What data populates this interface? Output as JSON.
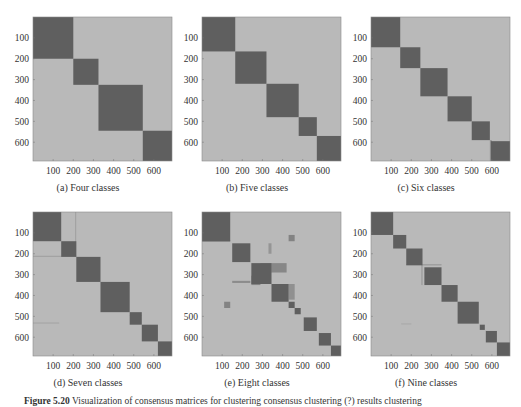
{
  "figure": {
    "label": "Figure 5.20",
    "caption_text": "Visualization of consensus matrices for clustering consensus clustering (?) results clustering"
  },
  "colors": {
    "background_cell": "#b9b9b9",
    "block": "#5f5f5f",
    "frame": "#8a8a8a"
  },
  "chart_data": [
    {
      "type": "heatmap",
      "title": "(a) Four classes",
      "xlabel": "",
      "ylabel": "",
      "xlim": [
        0,
        690
      ],
      "ylim": [
        0,
        690
      ],
      "xticks": [
        100,
        200,
        300,
        400,
        500,
        600
      ],
      "yticks": [
        100,
        200,
        300,
        400,
        500,
        600
      ],
      "blocks": [
        [
          0,
          200
        ],
        [
          200,
          325
        ],
        [
          325,
          545
        ],
        [
          545,
          690
        ]
      ],
      "noise": []
    },
    {
      "type": "heatmap",
      "title": "(b) Five classes",
      "xlabel": "",
      "ylabel": "",
      "xlim": [
        0,
        690
      ],
      "ylim": [
        0,
        690
      ],
      "xticks": [
        100,
        200,
        300,
        400,
        500,
        600
      ],
      "yticks": [
        100,
        200,
        300,
        400,
        500,
        600
      ],
      "blocks": [
        [
          0,
          165
        ],
        [
          165,
          320
        ],
        [
          320,
          480
        ],
        [
          480,
          570
        ],
        [
          570,
          690
        ]
      ],
      "noise": []
    },
    {
      "type": "heatmap",
      "title": "(c) Six classes",
      "xlabel": "",
      "ylabel": "",
      "xlim": [
        0,
        690
      ],
      "ylim": [
        0,
        690
      ],
      "xticks": [
        100,
        200,
        300,
        400,
        500,
        600
      ],
      "yticks": [
        100,
        200,
        300,
        400,
        500,
        600
      ],
      "blocks": [
        [
          0,
          145
        ],
        [
          145,
          245
        ],
        [
          245,
          380
        ],
        [
          380,
          500
        ],
        [
          500,
          590
        ],
        [
          595,
          690
        ]
      ],
      "noise": [
        [
          590,
          600,
          590,
          690,
          0.4
        ]
      ]
    },
    {
      "type": "heatmap",
      "title": "(d) Seven classes",
      "xlabel": "",
      "ylabel": "",
      "xlim": [
        0,
        690
      ],
      "ylim": [
        0,
        690
      ],
      "xticks": [
        100,
        200,
        300,
        400,
        500,
        600
      ],
      "yticks": [
        100,
        200,
        300,
        400,
        500,
        600
      ],
      "blocks": [
        [
          0,
          140
        ],
        [
          140,
          215
        ],
        [
          215,
          335
        ],
        [
          335,
          480
        ],
        [
          480,
          540
        ],
        [
          540,
          620
        ],
        [
          620,
          690
        ]
      ],
      "noise": [
        [
          0,
          215,
          210,
          214,
          0.35
        ],
        [
          210,
          214,
          0,
          215,
          0.35
        ],
        [
          0,
          130,
          530,
          534,
          0.3
        ],
        [
          480,
          540,
          495,
          498,
          0.3
        ]
      ]
    },
    {
      "type": "heatmap",
      "title": "(e) Eight classes",
      "xlabel": "",
      "ylabel": "",
      "xlim": [
        0,
        690
      ],
      "ylim": [
        0,
        690
      ],
      "xticks": [
        100,
        200,
        300,
        400,
        500,
        600
      ],
      "yticks": [
        100,
        200,
        300,
        400,
        500,
        600
      ],
      "blocks": [
        [
          0,
          140
        ],
        [
          150,
          240
        ],
        [
          245,
          345
        ],
        [
          345,
          430
        ],
        [
          430,
          460
        ],
        [
          460,
          490
        ],
        [
          505,
          570
        ],
        [
          580,
          640
        ],
        [
          640,
          690
        ]
      ],
      "noise": [
        [
          245,
          290,
          305,
          350,
          0.6
        ],
        [
          290,
          345,
          245,
          290,
          0.55
        ],
        [
          345,
          420,
          245,
          290,
          0.55
        ],
        [
          430,
          460,
          110,
          140,
          0.6
        ],
        [
          110,
          140,
          430,
          460,
          0.6
        ],
        [
          150,
          240,
          330,
          340,
          0.5
        ],
        [
          330,
          345,
          150,
          200,
          0.4
        ],
        [
          430,
          460,
          345,
          420,
          0.45
        ],
        [
          0,
          140,
          135,
          142,
          0.6
        ]
      ]
    },
    {
      "type": "heatmap",
      "title": "(f) Nine classes",
      "xlabel": "",
      "ylabel": "",
      "xlim": [
        0,
        690
      ],
      "ylim": [
        0,
        690
      ],
      "xticks": [
        100,
        200,
        300,
        400,
        500,
        600
      ],
      "yticks": [
        100,
        200,
        300,
        400,
        500,
        600
      ],
      "blocks": [
        [
          0,
          110
        ],
        [
          110,
          175
        ],
        [
          175,
          255
        ],
        [
          265,
          350
        ],
        [
          350,
          430
        ],
        [
          430,
          535
        ],
        [
          540,
          565
        ],
        [
          570,
          625
        ],
        [
          625,
          690
        ]
      ],
      "noise": [
        [
          175,
          350,
          250,
          256,
          0.35
        ],
        [
          250,
          256,
          175,
          350,
          0.35
        ],
        [
          150,
          200,
          535,
          538,
          0.3
        ]
      ]
    }
  ]
}
